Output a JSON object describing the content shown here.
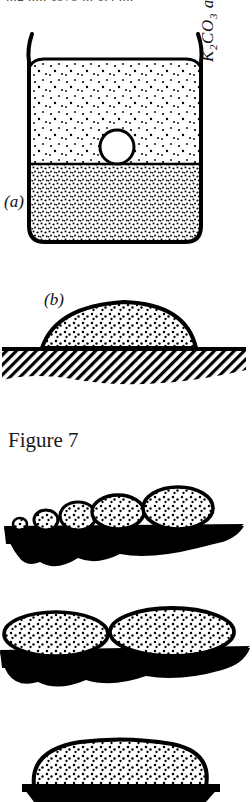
{
  "header": {
    "clipped_text": "...2 ..... 1979 ... 1.4 ...."
  },
  "figure": {
    "caption": "Figure 7",
    "panel_a": {
      "label": "(a)",
      "side_label_main": "K",
      "side_label_sub1": "2",
      "side_label_mid": "CO",
      "side_label_sub2": "3",
      "side_label_tail": " alcohol",
      "side_label_full": "K2CO3 alcohol",
      "upper_layer_name": "alcohol",
      "lower_layer_name": "K2CO3 solution",
      "bubble_name": "droplet-at-interface"
    },
    "panel_b": {
      "label": "(b)",
      "drop_name": "sessile-drop",
      "substrate_name": "hatched-substrate"
    }
  },
  "micrographs": [
    {
      "name": "micrograph-row-1",
      "drop_count": 5,
      "description": "five stippled ellipses increasing in size on black substrate"
    },
    {
      "name": "micrograph-row-2",
      "drop_count": 2,
      "description": "two large flattened stippled ellipses on black substrate"
    },
    {
      "name": "micrograph-row-3",
      "drop_count": 1,
      "description": "single large stippled dome on black base"
    }
  ],
  "colors": {
    "ink": "#000000",
    "paper": "#ffffff",
    "faded_ink": "#2b2b2b"
  }
}
